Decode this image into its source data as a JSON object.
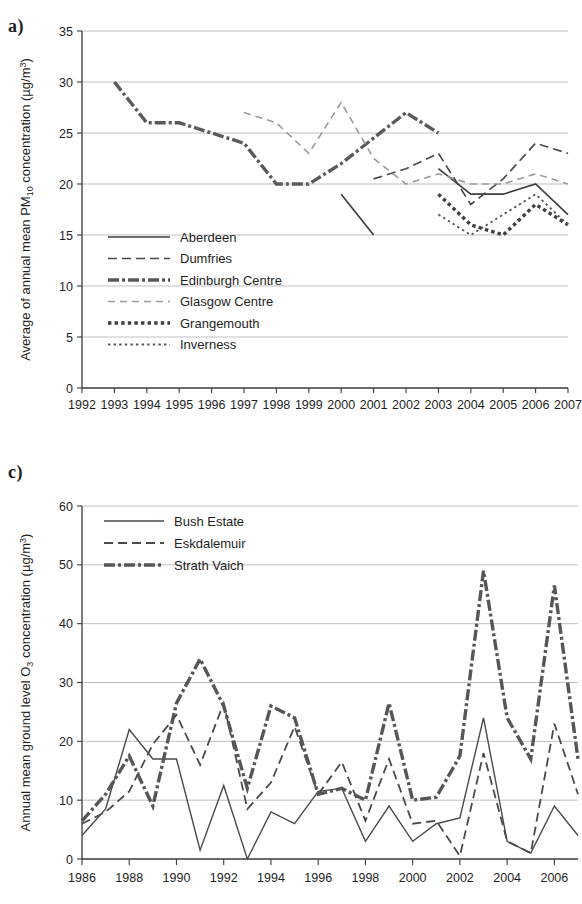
{
  "figure": {
    "panel_a_letter": "a)",
    "panel_c_letter": "c)"
  },
  "chart_data": [
    {
      "panel": "a)",
      "type": "line",
      "title": "",
      "xlabel": "",
      "ylabel": "Average of annual mean PM10 concentration (µg/m3)",
      "ylabel_parts": {
        "pre": "Average of annual mean PM",
        "sub": "10",
        "mid": " concentration (µg/m",
        "sup": "3",
        "post": ")"
      },
      "x": [
        1992,
        1993,
        1994,
        1995,
        1996,
        1997,
        1998,
        1999,
        2000,
        2001,
        2002,
        2003,
        2004,
        2005,
        2006,
        2007
      ],
      "xlim": [
        1992,
        2007
      ],
      "ylim": [
        0,
        35
      ],
      "yticks": [
        0,
        5,
        10,
        15,
        20,
        25,
        30,
        35
      ],
      "xticks": [
        "1992",
        "1993",
        "1994",
        "1995",
        "1996",
        "1997",
        "1998",
        "1999",
        "2000",
        "2001",
        "2002",
        "2003",
        "2004",
        "2005",
        "2006",
        "2007"
      ],
      "grid": true,
      "legend_position": "inside-left",
      "series": [
        {
          "name": "Aberdeen",
          "style": "solid",
          "points": [
            {
              "x": 2000,
              "y": 19.0
            },
            {
              "x": 2001,
              "y": 15.0
            }
          ],
          "points2": [
            {
              "x": 2003,
              "y": 21.5
            },
            {
              "x": 2004,
              "y": 19.0
            },
            {
              "x": 2005,
              "y": 19.0
            },
            {
              "x": 2006,
              "y": 20.0
            },
            {
              "x": 2007,
              "y": 17.0
            }
          ]
        },
        {
          "name": "Dumfries",
          "style": "dashed",
          "points": [
            {
              "x": 2001,
              "y": 20.5
            },
            {
              "x": 2002,
              "y": 21.5
            },
            {
              "x": 2003,
              "y": 23.0
            },
            {
              "x": 2004,
              "y": 18.0
            },
            {
              "x": 2005,
              "y": 20.5
            },
            {
              "x": 2006,
              "y": 24.0
            },
            {
              "x": 2007,
              "y": 23.0
            }
          ]
        },
        {
          "name": "Edinburgh Centre",
          "style": "thick-dash-dot",
          "points": [
            {
              "x": 1993,
              "y": 30.0
            },
            {
              "x": 1994,
              "y": 26.0
            },
            {
              "x": 1995,
              "y": 26.0
            },
            {
              "x": 1996,
              "y": 25.0
            },
            {
              "x": 1997,
              "y": 24.0
            },
            {
              "x": 1998,
              "y": 20.0
            },
            {
              "x": 1999,
              "y": 20.0
            },
            {
              "x": 2000,
              "y": 22.0
            },
            {
              "x": 2001,
              "y": 24.5
            },
            {
              "x": 2002,
              "y": 27.0
            },
            {
              "x": 2003,
              "y": 25.0
            }
          ]
        },
        {
          "name": "Glasgow Centre",
          "style": "light-dashed",
          "points": [
            {
              "x": 1997,
              "y": 27.0
            },
            {
              "x": 1998,
              "y": 26.0
            },
            {
              "x": 1999,
              "y": 23.0
            },
            {
              "x": 2000,
              "y": 28.0
            },
            {
              "x": 2001,
              "y": 22.5
            },
            {
              "x": 2002,
              "y": 20.0
            },
            {
              "x": 2003,
              "y": 21.0
            },
            {
              "x": 2004,
              "y": 20.0
            },
            {
              "x": 2005,
              "y": 20.0
            },
            {
              "x": 2006,
              "y": 21.0
            },
            {
              "x": 2007,
              "y": 20.0
            }
          ]
        },
        {
          "name": "Grangemouth",
          "style": "thick-dotted",
          "points": [
            {
              "x": 2003,
              "y": 19.0
            },
            {
              "x": 2004,
              "y": 16.0
            },
            {
              "x": 2005,
              "y": 15.0
            },
            {
              "x": 2006,
              "y": 18.0
            },
            {
              "x": 2007,
              "y": 16.0
            }
          ]
        },
        {
          "name": "Inverness",
          "style": "fine-dotted",
          "points": [
            {
              "x": 2003,
              "y": 17.0
            },
            {
              "x": 2004,
              "y": 15.0
            },
            {
              "x": 2005,
              "y": 17.0
            },
            {
              "x": 2006,
              "y": 19.0
            },
            {
              "x": 2007,
              "y": 16.0
            }
          ]
        }
      ]
    },
    {
      "panel": "c)",
      "type": "line",
      "title": "",
      "xlabel": "",
      "ylabel": "Annual mean ground level O3 concentration (µg/m3)",
      "ylabel_parts": {
        "pre": "Annual mean ground level O",
        "sub": "3",
        "mid": "  concentration (µg/m",
        "sup": "3",
        "post": ")"
      },
      "x": [
        1986,
        1987,
        1988,
        1989,
        1990,
        1991,
        1992,
        1993,
        1994,
        1995,
        1996,
        1997,
        1998,
        1999,
        2000,
        2001,
        2002,
        2003,
        2004,
        2005,
        2006,
        2007
      ],
      "xlim": [
        1986,
        2007
      ],
      "ylim": [
        0,
        60
      ],
      "yticks": [
        0,
        10,
        20,
        30,
        40,
        50,
        60
      ],
      "xticks": [
        "1986",
        "1988",
        "1990",
        "1992",
        "1994",
        "1996",
        "1998",
        "2000",
        "2002",
        "2004",
        "2006"
      ],
      "grid": true,
      "legend_position": "inside-top-left",
      "series": [
        {
          "name": "Bush Estate",
          "style": "solid",
          "values": [
            4.0,
            8.5,
            22.0,
            17.0,
            17.0,
            1.5,
            12.5,
            0.0,
            8.0,
            6.0,
            11.5,
            12.0,
            3.0,
            9.0,
            3.0,
            6.0,
            7.0,
            24.0,
            3.0,
            1.0,
            9.0,
            4.0
          ]
        },
        {
          "name": "Eskdalemuir",
          "style": "dashed",
          "values": [
            6.0,
            8.0,
            11.5,
            19.5,
            24.5,
            16.0,
            26.5,
            8.5,
            13.0,
            22.5,
            11.0,
            16.5,
            6.5,
            17.0,
            6.0,
            6.5,
            0.5,
            18.0,
            3.0,
            1.0,
            23.0,
            11.0
          ]
        },
        {
          "name": "Strath Vaich",
          "style": "thick-dash-dot",
          "values": [
            6.5,
            11.0,
            17.5,
            9.0,
            26.5,
            34.0,
            26.0,
            12.0,
            26.0,
            24.0,
            11.0,
            12.0,
            10.0,
            26.5,
            10.0,
            10.5,
            17.5,
            49.0,
            24.0,
            17.0,
            46.5,
            17.0
          ]
        }
      ]
    }
  ],
  "legend_a": [
    {
      "label": "Aberdeen",
      "style": "solid"
    },
    {
      "label": "Dumfries",
      "style": "dashed"
    },
    {
      "label": "Edinburgh Centre",
      "style": "thick-dash-dot"
    },
    {
      "label": "Glasgow Centre",
      "style": "light-dashed"
    },
    {
      "label": "Grangemouth",
      "style": "thick-dotted"
    },
    {
      "label": "Inverness",
      "style": "fine-dotted"
    }
  ],
  "legend_c": [
    {
      "label": "Bush Estate",
      "style": "solid"
    },
    {
      "label": "Eskdalemuir",
      "style": "dashed"
    },
    {
      "label": "Strath Vaich",
      "style": "thick-dash-dot"
    }
  ],
  "colors": {
    "line_dark": "#4a4a4a",
    "line_light": "#9a9a9a",
    "grid": "#b8b8b8",
    "axis": "#3a3a3a",
    "text": "#1e1e1e",
    "background": "#ffffff"
  }
}
